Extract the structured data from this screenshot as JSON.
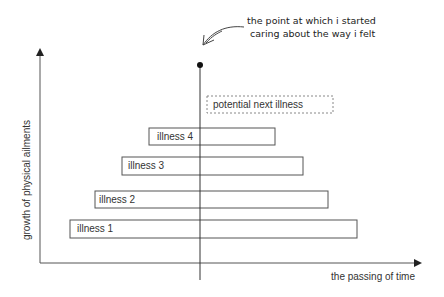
{
  "diagram": {
    "annotation": {
      "line1": "the point at which i started",
      "line2": "caring about the way i felt"
    },
    "x_axis_label": "the passing of time",
    "y_axis_label": "growth of physical ailments",
    "bars": [
      {
        "label": "illness 1",
        "style": "solid"
      },
      {
        "label": "illness 2",
        "style": "solid"
      },
      {
        "label": "illness 3",
        "style": "solid"
      },
      {
        "label": "illness 4",
        "style": "solid"
      },
      {
        "label": "potential next illness",
        "style": "dashed"
      }
    ],
    "colors": {
      "line": "#333333",
      "box_border": "#555555",
      "dashed_border": "#888888",
      "text": "#333333"
    }
  }
}
